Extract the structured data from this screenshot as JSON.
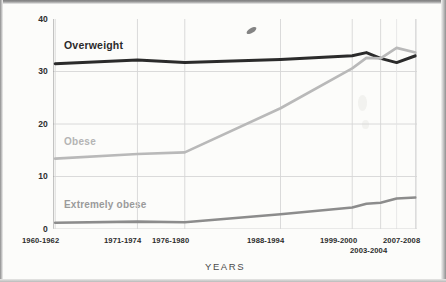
{
  "chart_data": {
    "type": "line",
    "title": "",
    "xlabel": "YEARS",
    "ylabel": "PERCENT",
    "ylim": [
      0,
      40
    ],
    "yticks": [
      0,
      10,
      20,
      30,
      40
    ],
    "grid": true,
    "legend_position": "inline-labels",
    "categories": [
      "1960-1962",
      "1971-1974",
      "1976-1980",
      "1988-1994",
      "1999-2000",
      "2001-2002",
      "2003-2004",
      "2005-2006",
      "2007-2008"
    ],
    "x_tick_labels_shown": [
      "1960-1962",
      "1971-1974",
      "1976-1980",
      "1988-1994",
      "1999-2000",
      "2003-2004",
      "2007-2008"
    ],
    "series": [
      {
        "name": "Overweight",
        "color": "#2b2b2b",
        "values": [
          31.5,
          32.2,
          31.7,
          32.3,
          33.0,
          33.6,
          32.5,
          31.7,
          33.0
        ]
      },
      {
        "name": "Obese",
        "color": "#b9b9b9",
        "values": [
          13.4,
          14.3,
          14.6,
          23.0,
          30.6,
          32.6,
          32.5,
          34.5,
          33.6
        ]
      },
      {
        "name": "Extremely obese",
        "color": "#8c8c8c",
        "values": [
          1.2,
          1.4,
          1.3,
          2.8,
          4.1,
          4.8,
          5.0,
          5.8,
          6.0
        ]
      }
    ]
  },
  "axis": {
    "y_title": "PERCENT",
    "x_title": "YEARS",
    "y_tick_labels": [
      "40",
      "30",
      "20",
      "10",
      "0"
    ],
    "x_tick_row1": [
      "1960-1962",
      "1971-1974",
      "1976-1980",
      "1988-1994",
      "1999-2000",
      "2007-2008"
    ],
    "x_tick_row2": [
      "2003-2004"
    ]
  },
  "series_labels": {
    "overweight": "Overweight",
    "obese": "Obese",
    "extremely_obese": "Extremely obese"
  },
  "colors": {
    "overweight": "#2b2b2b",
    "obese": "#b9b9b9",
    "extremely_obese": "#8c8c8c",
    "grid": "#d6d6d6",
    "axis": "#8a8a8a",
    "paper": "#fcfcfa"
  }
}
